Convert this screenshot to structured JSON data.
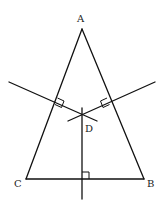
{
  "diagram": {
    "type": "geometry",
    "points": {
      "A": {
        "label": "A",
        "x": 82,
        "y": 29
      },
      "B": {
        "label": "B",
        "x": 144,
        "y": 179
      },
      "C": {
        "label": "C",
        "x": 26,
        "y": 179
      },
      "D": {
        "label": "D",
        "x": 82,
        "y": 115
      }
    },
    "labels": {
      "A": "A",
      "B": "B",
      "C": "C",
      "D": "D"
    },
    "segments": [
      "AB",
      "BC",
      "CA"
    ],
    "perpendicular_bisectors": [
      "of AC",
      "of AB",
      "of BC"
    ],
    "right_angle_marks": 3,
    "colors": {
      "stroke": "#111111",
      "background": "#ffffff"
    }
  }
}
